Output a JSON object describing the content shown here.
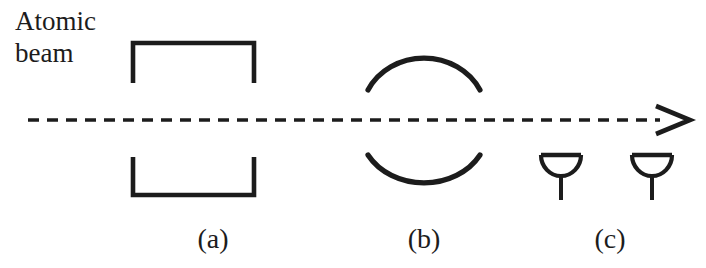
{
  "figure": {
    "background_color": "#ffffff",
    "ink_color": "#1c1c1c",
    "width": 706,
    "height": 268
  },
  "beam": {
    "caption_line1": "Atomic",
    "caption_line2": "beam",
    "style": "dashed",
    "arrow_direction": "right",
    "arrowhead_style": "open-chevron",
    "axis_y": 120,
    "start_x": 28,
    "end_x": 690,
    "dash_length": 11,
    "dash_gap": 8
  },
  "stages": [
    {
      "id": "a",
      "label": "(a)",
      "label_x": 213,
      "label_y": 248,
      "element_type": "magnet-brackets",
      "description": "Pair of open rectangular bracket pole pieces above and below the beam",
      "top": {
        "left_x": 133,
        "right_x": 254,
        "bar_y": 43,
        "leg_bottom_y": 83
      },
      "bottom": {
        "left_x": 133,
        "right_x": 254,
        "bar_y": 195,
        "leg_top_y": 157
      }
    },
    {
      "id": "b",
      "label": "(b)",
      "label_x": 424,
      "label_y": 248,
      "element_type": "lens-arcs",
      "description": "Two opposing arcs forming a split circular lens region around the beam",
      "top_arc": {
        "left_x": 368,
        "right_x": 480,
        "apex_y": 44,
        "ends_y": 90
      },
      "bottom_arc": {
        "left_x": 368,
        "right_x": 480,
        "apex_y": 200,
        "ends_y": 155
      }
    },
    {
      "id": "c",
      "label": "(c)",
      "label_x": 610,
      "label_y": 248,
      "element_type": "detector-antennas",
      "description": "Two funnel-shaped antenna/detector horns below the beam",
      "antennas": [
        {
          "center_x": 561,
          "bar_y": 155,
          "bar_half_width": 19,
          "bowl_depth": 21,
          "stem_bottom_y": 200
        },
        {
          "center_x": 652,
          "bar_y": 155,
          "bar_half_width": 19,
          "bowl_depth": 21,
          "stem_bottom_y": 200
        }
      ]
    }
  ]
}
